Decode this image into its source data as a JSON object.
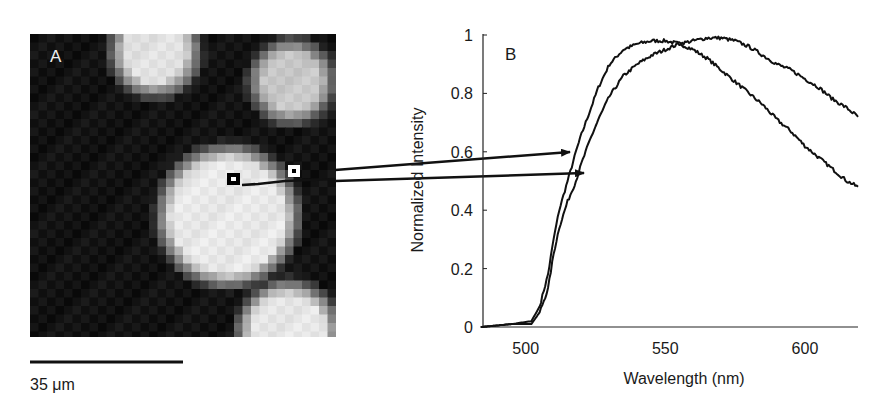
{
  "panel_a": {
    "label": "A",
    "scale_bar_label": "35 μm",
    "markers": [
      {
        "name": "inner-marker",
        "style": "black-square-white-center"
      },
      {
        "name": "outer-marker",
        "style": "white-square-black-center"
      }
    ]
  },
  "panel_b": {
    "label": "B",
    "xlabel": "Wavelength (nm)",
    "ylabel": "Normalized Intensity",
    "xticks": [
      "500",
      "550",
      "600"
    ],
    "yticks": [
      "0",
      "0.2",
      "0.4",
      "0.6",
      "0.8",
      "1"
    ]
  },
  "chart_data": {
    "type": "line",
    "title": "",
    "panel": "B",
    "xlabel": "Wavelength (nm)",
    "ylabel": "Normalized Intensity",
    "xlim": [
      484,
      619
    ],
    "ylim": [
      0,
      1
    ],
    "xticks": [
      500,
      550,
      600
    ],
    "yticks": [
      0,
      0.2,
      0.4,
      0.6,
      0.8,
      1
    ],
    "grid": false,
    "legend": null,
    "x": [
      484,
      495,
      502,
      505,
      508,
      510,
      512,
      515,
      518,
      520,
      523,
      526,
      530,
      535,
      540,
      545,
      550,
      555,
      560,
      565,
      570,
      575,
      580,
      585,
      590,
      595,
      600,
      605,
      610,
      615,
      619
    ],
    "series": [
      {
        "name": "Spectrum 1 (marker inside bright cell, upper arrow)",
        "values": [
          0.0,
          0.01,
          0.02,
          0.07,
          0.18,
          0.3,
          0.4,
          0.5,
          0.6,
          0.66,
          0.74,
          0.82,
          0.9,
          0.95,
          0.97,
          0.98,
          0.98,
          0.97,
          0.95,
          0.92,
          0.88,
          0.84,
          0.8,
          0.76,
          0.71,
          0.67,
          0.62,
          0.58,
          0.54,
          0.5,
          0.48
        ]
      },
      {
        "name": "Spectrum 2 (marker outside cell, lower arrow)",
        "values": [
          0.0,
          0.01,
          0.01,
          0.05,
          0.13,
          0.25,
          0.34,
          0.43,
          0.5,
          0.56,
          0.64,
          0.71,
          0.79,
          0.86,
          0.9,
          0.93,
          0.95,
          0.97,
          0.98,
          0.99,
          0.99,
          0.98,
          0.96,
          0.93,
          0.9,
          0.88,
          0.85,
          0.82,
          0.78,
          0.75,
          0.72
        ]
      }
    ],
    "annotations": [
      "Arrow from outer marker (panel A) to Spectrum 1 at ~0.59",
      "Arrow from inner marker (panel A) to Spectrum 2 at ~0.52"
    ]
  }
}
